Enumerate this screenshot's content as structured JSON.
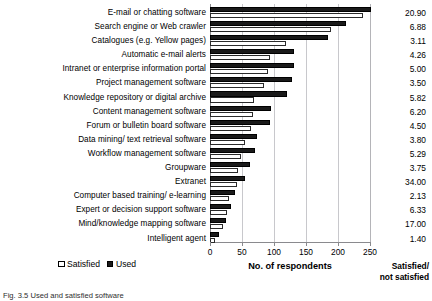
{
  "chart_data": {
    "type": "bar",
    "orientation": "horizontal",
    "title": "",
    "xlabel": "No. of respondents",
    "ylabel": "",
    "xlim": [
      0,
      250
    ],
    "xticks": [
      0,
      50,
      100,
      150,
      200,
      250
    ],
    "xtick_labels": [
      "0",
      "50",
      "100",
      "150",
      "200",
      "250"
    ],
    "grid": true,
    "grid_axis": "x",
    "legend_position": "bottom-left",
    "categories": [
      "E-mail or chatting software",
      "Search engine or Web crawler",
      "Catalogues (e.g. Yellow pages)",
      "Automatic e-mail alerts",
      "Intranet or enterprise information portal",
      "Project management software",
      "Knowledge repository or digital archive",
      "Content management software",
      "Forum or bulletin board software",
      "Data mining/ text retrieval software",
      "Workflow management software",
      "Groupware",
      "Extranet",
      "Computer based training/ e-learning",
      "Expert or decision support software",
      "Mind/knowledge mapping software",
      "Intelligent agent"
    ],
    "series": [
      {
        "name": "Used",
        "color": "#1a1a1a",
        "values": [
          251,
          213,
          185,
          131,
          131,
          128,
          120,
          96,
          94,
          74,
          70,
          63,
          54,
          39,
          33,
          25,
          14
        ]
      },
      {
        "name": "Satisfied",
        "color": "#ffffff",
        "values": [
          239,
          189,
          118,
          93,
          90,
          85,
          69,
          67,
          64,
          55,
          49,
          43,
          42,
          30,
          27,
          21,
          8
        ]
      }
    ],
    "ratio_column": {
      "header_line1": "Satisfied/",
      "header_line2": "not satisfied",
      "values": [
        "20.90",
        "6.88",
        "3.11",
        "4.26",
        "5.00",
        "3.50",
        "5.82",
        "6.20",
        "4.50",
        "3.80",
        "5.29",
        "3.75",
        "34.00",
        "2.13",
        "6.33",
        "17.00",
        "1.40"
      ]
    }
  },
  "legend": {
    "items": [
      {
        "label": "Satisfied",
        "swatch": "open-square-icon"
      },
      {
        "label": "Used",
        "swatch": "filled-square-icon"
      }
    ]
  },
  "footer": {
    "caption": "Fig. 3.5 Used and satisfied software"
  }
}
